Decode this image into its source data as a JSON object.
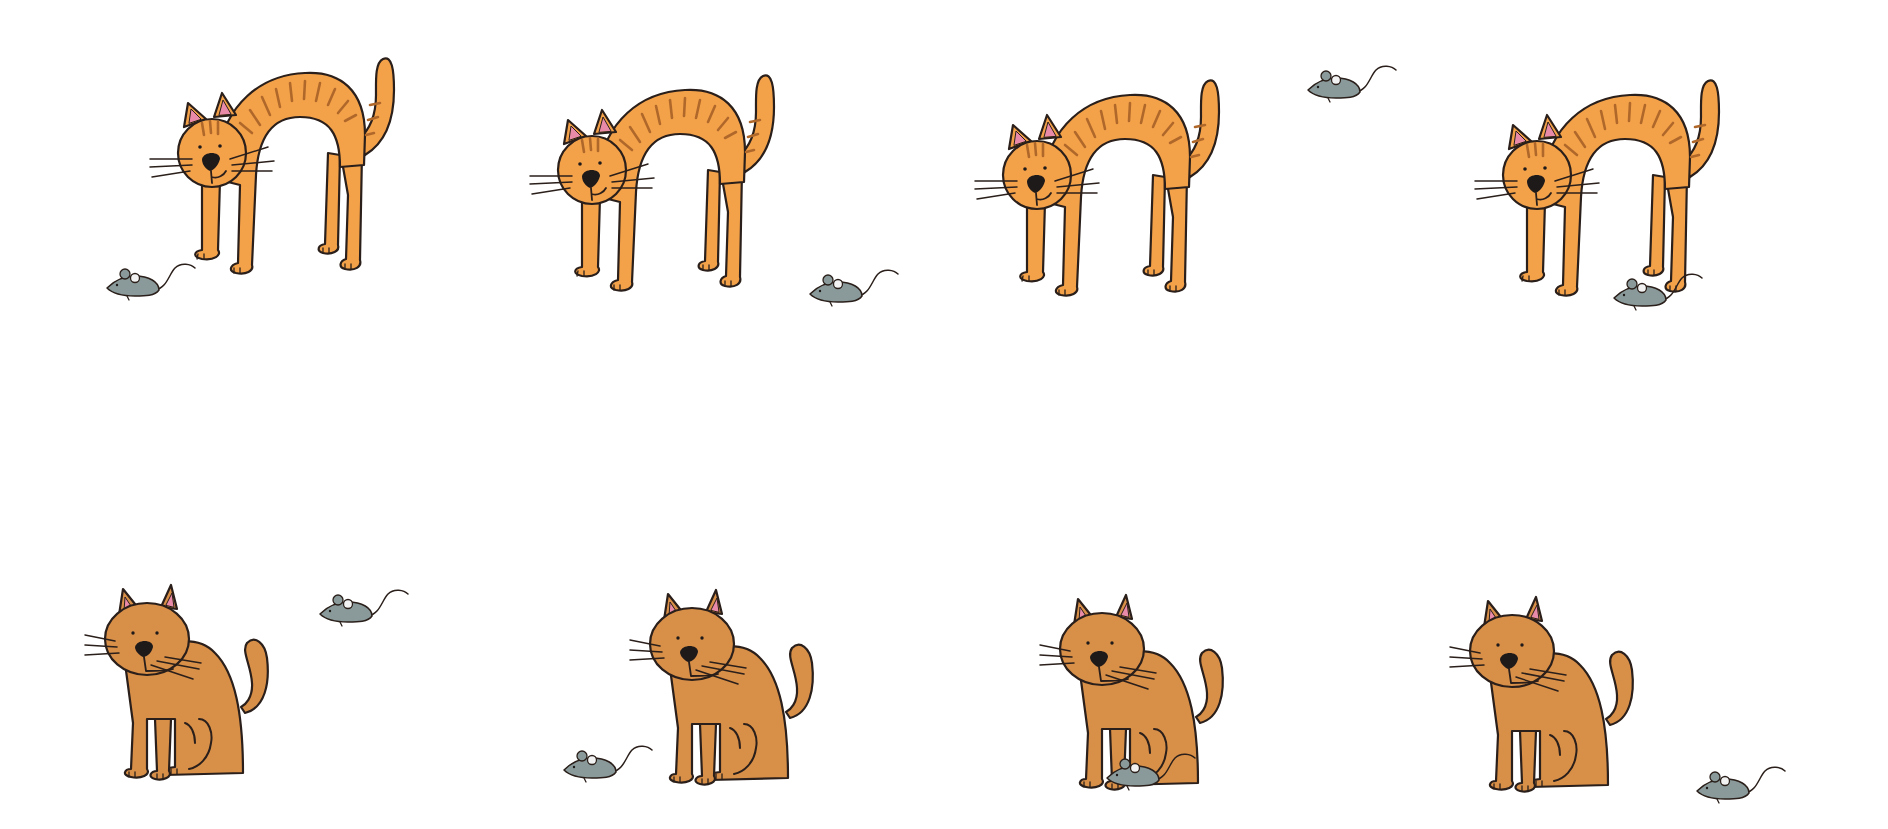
{
  "canvas": {
    "width": 1888,
    "height": 829,
    "background": "#ffffff"
  },
  "colors": {
    "arched_cat_fill": "#F4A24A",
    "sitting_cat_fill": "#D88F48",
    "stripe": "#B0682A",
    "outline": "#2a1f1a",
    "ear_inner": "#E88AA8",
    "nose": "#1f1a1a",
    "mouse_fill": "#8A9A9A",
    "mouse_ear_inner": "#f2f2f2"
  },
  "layout": {
    "rows": 2,
    "columns": 4
  },
  "panels": [
    {
      "index": 1,
      "row": 1,
      "cat_pose": "arched-standing",
      "cat_x": 180,
      "cat_y": 55,
      "mouse_x": 105,
      "mouse_y": 262,
      "mouse_position": "left-front-on-ground"
    },
    {
      "index": 2,
      "row": 1,
      "cat_pose": "arched-standing",
      "cat_x": 560,
      "cat_y": 72,
      "mouse_x": 808,
      "mouse_y": 268,
      "mouse_position": "right-behind-on-ground"
    },
    {
      "index": 3,
      "row": 1,
      "cat_pose": "arched-standing",
      "cat_x": 1005,
      "cat_y": 77,
      "mouse_x": 1306,
      "mouse_y": 64,
      "mouse_position": "above-right"
    },
    {
      "index": 4,
      "row": 1,
      "cat_pose": "arched-standing",
      "cat_x": 1505,
      "cat_y": 77,
      "mouse_x": 1612,
      "mouse_y": 272,
      "mouse_position": "under-arch"
    },
    {
      "index": 5,
      "row": 2,
      "cat_pose": "sitting",
      "cat_x": 95,
      "cat_y": 573,
      "mouse_x": 318,
      "mouse_y": 588,
      "mouse_position": "above-right"
    },
    {
      "index": 6,
      "row": 2,
      "cat_pose": "sitting",
      "cat_x": 640,
      "cat_y": 578,
      "mouse_x": 562,
      "mouse_y": 744,
      "mouse_position": "left-front-on-ground"
    },
    {
      "index": 7,
      "row": 2,
      "cat_pose": "sitting",
      "cat_x": 1050,
      "cat_y": 583,
      "mouse_x": 1105,
      "mouse_y": 752,
      "mouse_position": "under-cat"
    },
    {
      "index": 8,
      "row": 2,
      "cat_pose": "sitting",
      "cat_x": 1460,
      "cat_y": 585,
      "mouse_x": 1695,
      "mouse_y": 765,
      "mouse_position": "right-on-ground"
    }
  ]
}
